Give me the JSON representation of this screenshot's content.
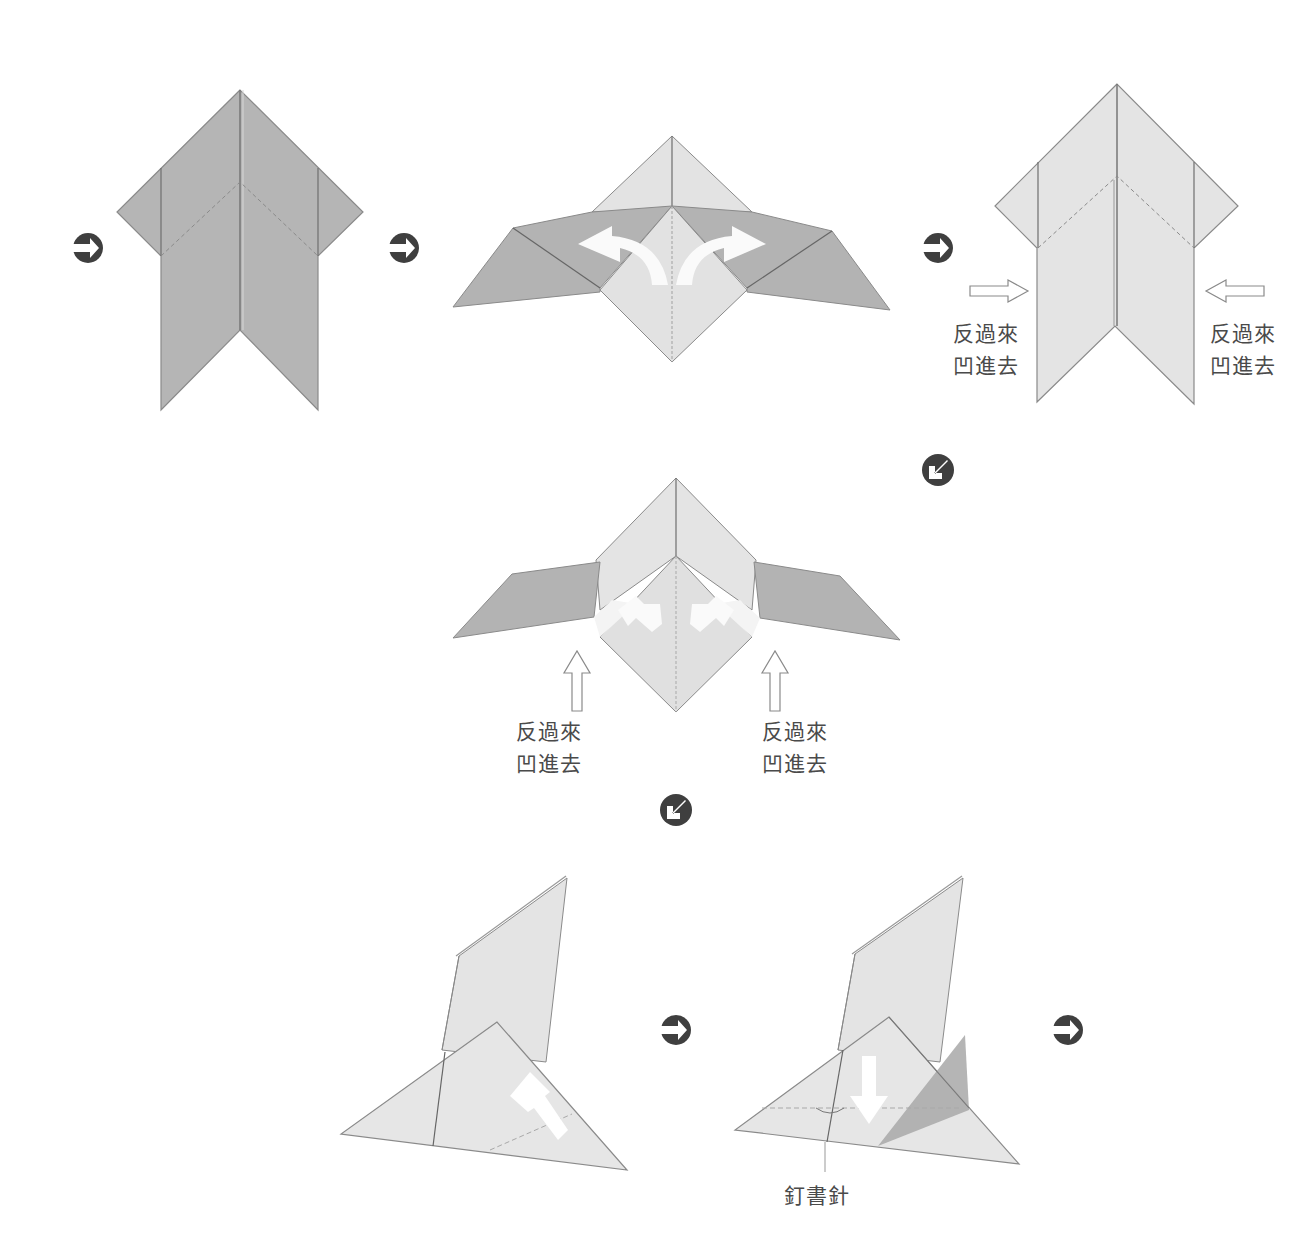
{
  "diagram": {
    "type": "origami-instructions",
    "colors": {
      "paper_dark": "#b3b3b3",
      "paper_light": "#e6e6e6",
      "paper_mid": "#cfcfcf",
      "edge": "#8a8a8a",
      "icon": "#3f3f3f",
      "text": "#4a4a4a"
    },
    "step_icons": [
      {
        "name": "step-arrow-right",
        "glyph": "arrow-right-circle",
        "x": 88,
        "y": 248
      },
      {
        "name": "step-arrow-right",
        "glyph": "arrow-right-circle",
        "x": 404,
        "y": 248
      },
      {
        "name": "step-arrow-right",
        "glyph": "arrow-right-circle",
        "x": 938,
        "y": 248
      },
      {
        "name": "step-arrow-down-left",
        "glyph": "arrow-down-left-circle",
        "x": 938,
        "y": 470
      },
      {
        "name": "step-arrow-down-left",
        "glyph": "arrow-down-left-circle",
        "x": 676,
        "y": 810
      },
      {
        "name": "step-arrow-right",
        "glyph": "arrow-right-circle",
        "x": 676,
        "y": 1030
      },
      {
        "name": "step-arrow-right",
        "glyph": "arrow-right-circle",
        "x": 1068,
        "y": 1030
      }
    ],
    "labels": {
      "step3_left": {
        "line1": "反過來",
        "line2": "凹進去"
      },
      "step3_right": {
        "line1": "反過來",
        "line2": "凹進去"
      },
      "step4_left": {
        "line1": "反過來",
        "line2": "凹進去"
      },
      "step4_right": {
        "line1": "反過來",
        "line2": "凹進去"
      },
      "step6_staple": "釘書針"
    },
    "steps": [
      {
        "id": 1,
        "description": "Dark paper arrow shape, front view"
      },
      {
        "id": 2,
        "description": "Wings folded out with curved white fold arrows"
      },
      {
        "id": 3,
        "description": "Light paper arrow shape with inward-pointing hollow arrows"
      },
      {
        "id": 4,
        "description": "Wings folded with upward hollow arrows"
      },
      {
        "id": 5,
        "description": "Side view with white diagonal arrow"
      },
      {
        "id": 6,
        "description": "Side view with down arrow and staple marker"
      }
    ]
  }
}
